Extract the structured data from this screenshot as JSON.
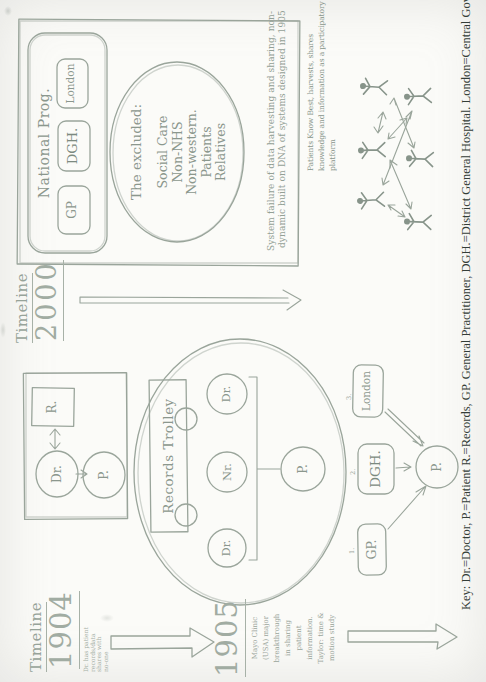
{
  "colors": {
    "paper": "#fbfbf8",
    "pencil_ink": "#9aa59b",
    "key_text": "#343d37"
  },
  "timeline_1904": {
    "heading": "Timeline",
    "year": "1904",
    "note_lines": [
      "Dr. has patient",
      "records/data",
      "shares with",
      "no-one"
    ],
    "year_next": "1905",
    "note_next_lines": [
      "Mayo Clinic",
      "(USA) major",
      "breakthrough",
      "in sharing",
      "patient",
      "information.",
      "Taylor: time &",
      "motion study"
    ]
  },
  "diagram_1904": {
    "records": "R.",
    "doctor": "Dr.",
    "patient": "P."
  },
  "diagram_1905": {
    "trolley": "Records Trolley",
    "doctor_left": "Dr.",
    "nurse": "Nr.",
    "doctor_right": "Dr.",
    "patient": "P."
  },
  "flow_1905": {
    "num_gp": "1.",
    "gp": "GP.",
    "num_dgh": "2.",
    "dgh": "DGH.",
    "num_london": "3.",
    "london": "London",
    "patient": "P."
  },
  "timeline_2000": {
    "heading": "Timeline",
    "year": "2000"
  },
  "prog_2000": {
    "title": "National Prog.",
    "gp": "GP",
    "dgh": "DGH.",
    "london": "London"
  },
  "excluded": {
    "heading": "The excluded:",
    "items": [
      "Social Care",
      "Non-NHS",
      "Non-western.",
      "Patients",
      "Relatives"
    ]
  },
  "annotations": {
    "system_failure_lines": [
      "System failure of data harvesting and sharing, non-",
      "dynamic built on DNA of systems designed in 1905"
    ],
    "pkb_lines": [
      "Patients Know Best, harvests, shares",
      "knowledge and information as a participatory",
      "platform"
    ]
  },
  "key_line": "Key: Dr.=Doctor, P.=Patient R.=Records, GP. General Practitioner, DGH.=District General Hospital. London=Central Government"
}
